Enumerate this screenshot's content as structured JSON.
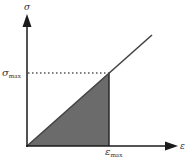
{
  "diagram": {
    "type": "stress-strain",
    "y_axis": {
      "label": "σ"
    },
    "x_axis": {
      "label": "ε"
    },
    "y_marker": {
      "symbol": "σ",
      "subscript": "max"
    },
    "x_marker": {
      "symbol": "ε",
      "subscript": "max"
    },
    "colors": {
      "axis": "#1a1a1a",
      "line": "#444444",
      "fill": "#6b6b6b",
      "dotted": "#555555"
    },
    "geometry": {
      "origin": [
        27,
        146
      ],
      "peak": [
        109,
        73
      ],
      "line_end": [
        152,
        35
      ],
      "y_axis_top": [
        27,
        14
      ],
      "x_axis_right": [
        178,
        146
      ]
    }
  }
}
